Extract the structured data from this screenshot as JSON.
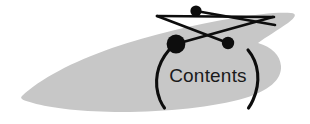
{
  "figure": {
    "name": "table-of-contents-graphic",
    "width": 310,
    "height": 124,
    "background_color": "#ffffff",
    "label": "Contents",
    "left_paren": "(",
    "right_paren": ")",
    "blob": {
      "name": "gray-blob-shape",
      "fill_color": "#c7c7c7",
      "description": "wing shaped gray region"
    },
    "node_link_diagram": {
      "name": "node-link-diagram",
      "stroke_color": "#0d0d0d",
      "node_color": "#0d0d0d",
      "nodes": [
        {
          "id": "node-top",
          "cx": 196,
          "cy": 11,
          "r": 5.6
        },
        {
          "id": "node-large-left",
          "cx": 176,
          "cy": 44,
          "r": 9.4
        },
        {
          "id": "node-right",
          "cx": 228,
          "cy": 43,
          "r": 6.2
        }
      ],
      "links": [
        {
          "id": "link-top-to-right-end",
          "x1": 196,
          "y1": 11,
          "x2": 275,
          "y2": 25
        },
        {
          "id": "link-leftend-to-rightend",
          "x1": 157,
          "y1": 16,
          "x2": 274,
          "y2": 17
        },
        {
          "id": "link-large-to-rightend",
          "x1": 176,
          "y1": 44,
          "x2": 273,
          "y2": 17
        },
        {
          "id": "link-leftend-to-right-node",
          "x1": 157,
          "y1": 16,
          "x2": 228,
          "y2": 43
        }
      ]
    },
    "parentheses": {
      "name": "parentheses-pair",
      "stroke_color": "#0d0d0d",
      "left": {
        "x_top": 168,
        "y_top": 50,
        "x_bottom": 163,
        "y_bottom": 108
      },
      "right": {
        "x_top": 249,
        "y_top": 50,
        "x_bottom": 251,
        "y_bottom": 108
      }
    },
    "text_color": "#1a1a1a"
  }
}
